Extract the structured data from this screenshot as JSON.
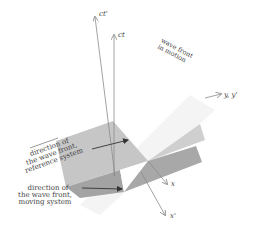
{
  "diagram": {
    "axes": {
      "ct_prime": "ct'",
      "ct": "ct",
      "y_yprime": "y, y'",
      "x": "x",
      "x_prime": "x'"
    },
    "labels": {
      "wave_front_motion_line1": "wave front",
      "wave_front_motion_line2": "in motion",
      "reference_line1": "direction of",
      "reference_line2": "the wave front,",
      "reference_line3": "reference system",
      "moving_line1": "direction of",
      "moving_line2": "the wave front,",
      "moving_line3": "moving system"
    },
    "colors": {
      "plane_light": "#c9c9c9",
      "plane_mid": "#b5b5b5",
      "plane_dark": "#9e9e9e",
      "motion_plane": "#f3f3f3",
      "axis": "#8a8a8a",
      "arrow": "#333333",
      "text": "#444444"
    }
  }
}
